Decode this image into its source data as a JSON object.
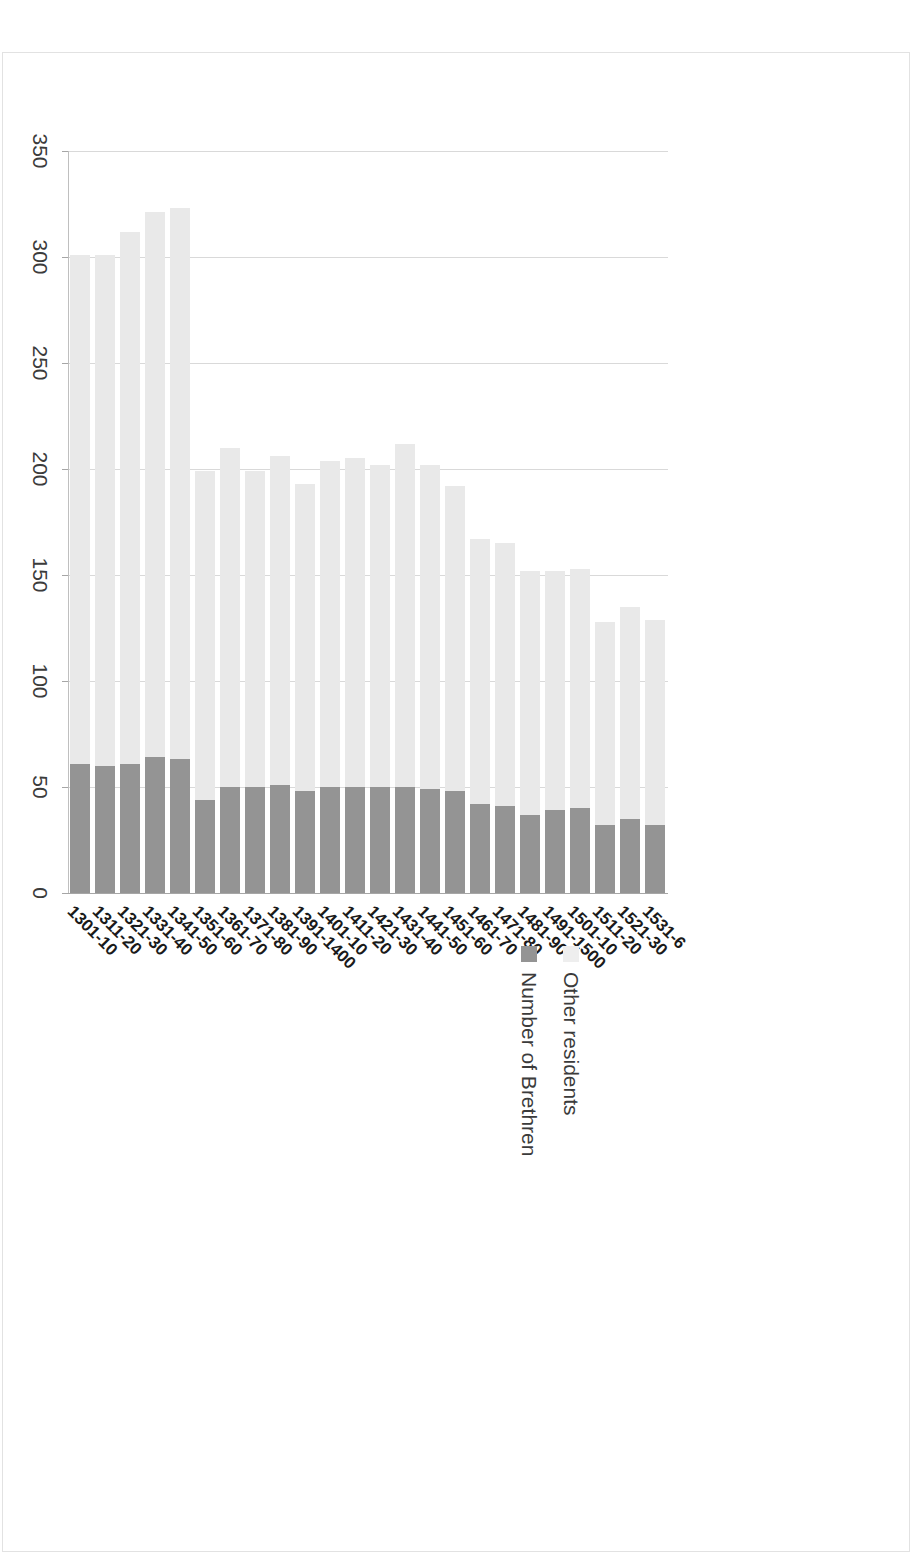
{
  "chart_data": {
    "type": "bar",
    "orientation": "horizontal-rotated",
    "title": "",
    "xlabel": "",
    "ylabel": "",
    "stacked": true,
    "grid": true,
    "legend_position": "top-right",
    "xlim": [
      0,
      350
    ],
    "ticks": [
      0,
      50,
      100,
      150,
      200,
      250,
      300,
      350
    ],
    "tick_labels": [
      "0",
      "50",
      "100",
      "150",
      "200",
      "250",
      "300",
      "350"
    ],
    "categories": [
      "1301-10",
      "1311-20",
      "1321-30",
      "1331-40",
      "1341-50",
      "1351-60",
      "1361-70",
      "1371-80",
      "1381-90",
      "1391-1400",
      "1401-10",
      "1411-20",
      "1421-30",
      "1431-40",
      "1441-50",
      "1451-60",
      "1461-70",
      "1471-80",
      "1481-90",
      "1491-1500",
      "1501-10",
      "1511-20",
      "1521-30",
      "1531-6"
    ],
    "series": [
      {
        "name": "Number of Brethren",
        "color": "#949494",
        "values": [
          61,
          60,
          61,
          64,
          63,
          44,
          50,
          50,
          51,
          48,
          50,
          50,
          50,
          50,
          49,
          48,
          42,
          41,
          37,
          39,
          40,
          32,
          35,
          32
        ]
      },
      {
        "name": "Other residents",
        "color": "#e9e9e9",
        "values": [
          240,
          241,
          251,
          257,
          260,
          155,
          160,
          149,
          155,
          145,
          154,
          155,
          152,
          162,
          153,
          144,
          125,
          124,
          115,
          113,
          113,
          96,
          100,
          97
        ]
      }
    ],
    "totals": [
      301,
      301,
      312,
      321,
      323,
      199,
      210,
      199,
      206,
      193,
      204,
      205,
      202,
      212,
      202,
      192,
      167,
      165,
      152,
      152,
      153,
      128,
      135,
      129
    ]
  },
  "legend": {
    "items": [
      {
        "label": "Other residents",
        "swatch": "other-residents-swatch"
      },
      {
        "label": "Number of Brethren",
        "swatch": "number-of-brethren-swatch"
      }
    ]
  }
}
